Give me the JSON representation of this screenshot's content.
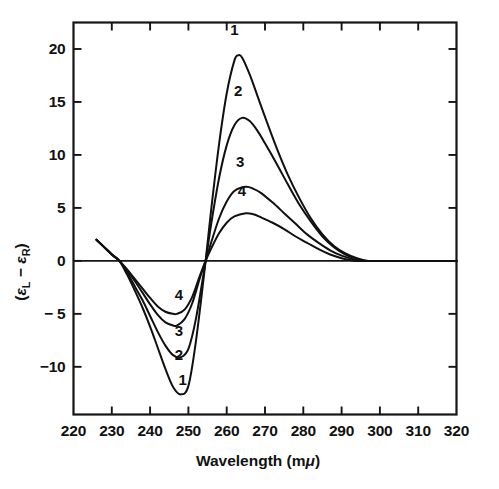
{
  "figure": {
    "background_color": "#ffffff",
    "ink_color": "#111111"
  },
  "chart_data": {
    "type": "line",
    "title": "",
    "subtitle": "",
    "xlabel": "Wavelength (mμ)",
    "xlabel_parts": {
      "main": "Wavelength (m",
      "italic_symbol": "μ",
      "tail": ")"
    },
    "ylabel": "(εL − εR)",
    "ylabel_parts": {
      "open": "(",
      "eps1": "ε",
      "sub1": "L",
      "minus": " − ",
      "eps2": "ε",
      "sub2": "R",
      "close": ")"
    },
    "xlim": [
      220,
      320
    ],
    "ylim": [
      -14.5,
      22.5
    ],
    "xticks": [
      220,
      230,
      240,
      250,
      260,
      270,
      280,
      290,
      300,
      310,
      320
    ],
    "xtick_labels": [
      "220",
      "230",
      "240",
      "250",
      "260",
      "270",
      "280",
      "290",
      "300",
      "310",
      "320"
    ],
    "yticks": [
      -10,
      -5,
      0,
      5,
      10,
      15,
      20
    ],
    "ytick_labels": [
      "−10",
      "− 5",
      "0",
      "5",
      "10",
      "15",
      "20"
    ],
    "grid": false,
    "legend_position": "inline-curve-labels",
    "zero_line": true,
    "ticks_inward_all_sides": true,
    "series": [
      {
        "name": "1",
        "label": "1",
        "peak_x": 263,
        "peak_y": 19.4,
        "trough_x": 248,
        "trough_y": -12.6,
        "zero_crossings": [
          232,
          254.5,
          297
        ],
        "points": [
          [
            226.0,
            2.0
          ],
          [
            228.0,
            1.3
          ],
          [
            230.0,
            0.6
          ],
          [
            232.0,
            0.0
          ],
          [
            234.0,
            -1.3
          ],
          [
            236.0,
            -2.8
          ],
          [
            238.0,
            -4.4
          ],
          [
            240.0,
            -6.2
          ],
          [
            242.0,
            -8.2
          ],
          [
            244.0,
            -10.2
          ],
          [
            246.0,
            -11.9
          ],
          [
            248.0,
            -12.6
          ],
          [
            250.0,
            -11.8
          ],
          [
            252.0,
            -7.5
          ],
          [
            254.5,
            0.0
          ],
          [
            256.0,
            5.0
          ],
          [
            258.0,
            11.0
          ],
          [
            260.0,
            15.8
          ],
          [
            262.0,
            18.9
          ],
          [
            263.0,
            19.4
          ],
          [
            264.0,
            19.2
          ],
          [
            266.0,
            17.6
          ],
          [
            268.0,
            15.6
          ],
          [
            270.0,
            13.6
          ],
          [
            273.0,
            10.7
          ],
          [
            276.0,
            8.1
          ],
          [
            279.0,
            5.9
          ],
          [
            282.0,
            4.0
          ],
          [
            285.0,
            2.5
          ],
          [
            288.0,
            1.4
          ],
          [
            291.0,
            0.7
          ],
          [
            294.0,
            0.25
          ],
          [
            297.0,
            0.0
          ],
          [
            300.0,
            0.0
          ],
          [
            320.0,
            0.0
          ]
        ]
      },
      {
        "name": "2",
        "label": "2",
        "peak_x": 264,
        "peak_y": 13.5,
        "trough_x": 248,
        "trough_y": -9.1,
        "zero_crossings": [
          232,
          254.5,
          296
        ],
        "points": [
          [
            226.0,
            2.0
          ],
          [
            228.0,
            1.3
          ],
          [
            230.0,
            0.6
          ],
          [
            232.0,
            0.0
          ],
          [
            234.0,
            -1.1
          ],
          [
            236.0,
            -2.4
          ],
          [
            238.0,
            -3.7
          ],
          [
            240.0,
            -5.2
          ],
          [
            242.0,
            -6.7
          ],
          [
            244.0,
            -8.0
          ],
          [
            246.0,
            -8.9
          ],
          [
            248.0,
            -9.1
          ],
          [
            250.0,
            -8.3
          ],
          [
            252.0,
            -5.4
          ],
          [
            254.5,
            0.0
          ],
          [
            256.0,
            3.6
          ],
          [
            258.0,
            7.8
          ],
          [
            260.0,
            10.9
          ],
          [
            262.0,
            12.8
          ],
          [
            264.0,
            13.5
          ],
          [
            266.0,
            13.2
          ],
          [
            268.0,
            12.3
          ],
          [
            270.0,
            11.1
          ],
          [
            273.0,
            9.2
          ],
          [
            276.0,
            7.2
          ],
          [
            279.0,
            5.3
          ],
          [
            282.0,
            3.7
          ],
          [
            285.0,
            2.3
          ],
          [
            288.0,
            1.3
          ],
          [
            291.0,
            0.6
          ],
          [
            294.0,
            0.2
          ],
          [
            296.0,
            0.0
          ],
          [
            300.0,
            0.0
          ],
          [
            320.0,
            0.0
          ]
        ]
      },
      {
        "name": "3",
        "label": "3",
        "peak_x": 265,
        "peak_y": 7.0,
        "trough_x": 247,
        "trough_y": -6.1,
        "zero_crossings": [
          232,
          254.5,
          295
        ],
        "points": [
          [
            226.0,
            2.0
          ],
          [
            228.0,
            1.3
          ],
          [
            230.0,
            0.6
          ],
          [
            232.0,
            0.0
          ],
          [
            234.0,
            -0.9
          ],
          [
            236.0,
            -1.9
          ],
          [
            238.0,
            -3.0
          ],
          [
            240.0,
            -4.1
          ],
          [
            242.0,
            -5.1
          ],
          [
            244.0,
            -5.8
          ],
          [
            246.0,
            -6.1
          ],
          [
            247.0,
            -6.1
          ],
          [
            249.0,
            -5.5
          ],
          [
            251.0,
            -4.0
          ],
          [
            253.0,
            -1.6
          ],
          [
            254.5,
            0.0
          ],
          [
            256.0,
            1.8
          ],
          [
            258.0,
            4.0
          ],
          [
            260.0,
            5.6
          ],
          [
            262.0,
            6.6
          ],
          [
            265.0,
            7.0
          ],
          [
            267.0,
            6.8
          ],
          [
            269.0,
            6.4
          ],
          [
            272.0,
            5.5
          ],
          [
            275.0,
            4.5
          ],
          [
            278.0,
            3.5
          ],
          [
            281.0,
            2.5
          ],
          [
            284.0,
            1.7
          ],
          [
            287.0,
            1.0
          ],
          [
            290.0,
            0.5
          ],
          [
            293.0,
            0.15
          ],
          [
            295.0,
            0.0
          ],
          [
            300.0,
            0.0
          ],
          [
            320.0,
            0.0
          ]
        ]
      },
      {
        "name": "4",
        "label": "4",
        "peak_x": 265,
        "peak_y": 4.5,
        "trough_x": 247,
        "trough_y": -5.0,
        "zero_crossings": [
          232,
          254.5,
          294
        ],
        "points": [
          [
            226.0,
            2.0
          ],
          [
            228.0,
            1.3
          ],
          [
            230.0,
            0.6
          ],
          [
            232.0,
            0.0
          ],
          [
            234.0,
            -0.8
          ],
          [
            236.0,
            -1.7
          ],
          [
            238.0,
            -2.6
          ],
          [
            240.0,
            -3.5
          ],
          [
            242.0,
            -4.3
          ],
          [
            244.0,
            -4.8
          ],
          [
            246.0,
            -5.0
          ],
          [
            247.0,
            -5.0
          ],
          [
            249.0,
            -4.6
          ],
          [
            251.0,
            -3.4
          ],
          [
            253.0,
            -1.4
          ],
          [
            254.5,
            0.0
          ],
          [
            256.0,
            1.2
          ],
          [
            258.0,
            2.6
          ],
          [
            260.0,
            3.6
          ],
          [
            262.0,
            4.2
          ],
          [
            265.0,
            4.5
          ],
          [
            267.0,
            4.4
          ],
          [
            269.0,
            4.1
          ],
          [
            272.0,
            3.6
          ],
          [
            275.0,
            3.0
          ],
          [
            278.0,
            2.3
          ],
          [
            281.0,
            1.7
          ],
          [
            284.0,
            1.1
          ],
          [
            287.0,
            0.6
          ],
          [
            290.0,
            0.25
          ],
          [
            292.0,
            0.1
          ],
          [
            294.0,
            0.0
          ],
          [
            300.0,
            0.0
          ],
          [
            320.0,
            0.0
          ]
        ]
      }
    ],
    "curve_labels": [
      {
        "text": "1",
        "x": 262.0,
        "y": 21.3,
        "series": "1",
        "position": "above-peak"
      },
      {
        "text": "2",
        "x": 263.0,
        "y": 15.6,
        "series": "2",
        "position": "above-peak"
      },
      {
        "text": "3",
        "x": 263.5,
        "y": 8.9,
        "series": "3",
        "position": "above-peak"
      },
      {
        "text": "4",
        "x": 264.0,
        "y": 6.1,
        "series": "4",
        "position": "above-peak"
      },
      {
        "text": "4",
        "x": 247.5,
        "y": -3.7,
        "series": "4",
        "position": "above-trough"
      },
      {
        "text": "3",
        "x": 247.5,
        "y": -7.1,
        "series": "3",
        "position": "above-trough"
      },
      {
        "text": "2",
        "x": 247.5,
        "y": -9.4,
        "series": "2",
        "position": "above-trough"
      },
      {
        "text": "1",
        "x": 248.5,
        "y": -11.7,
        "series": "1",
        "position": "above-trough"
      }
    ]
  }
}
